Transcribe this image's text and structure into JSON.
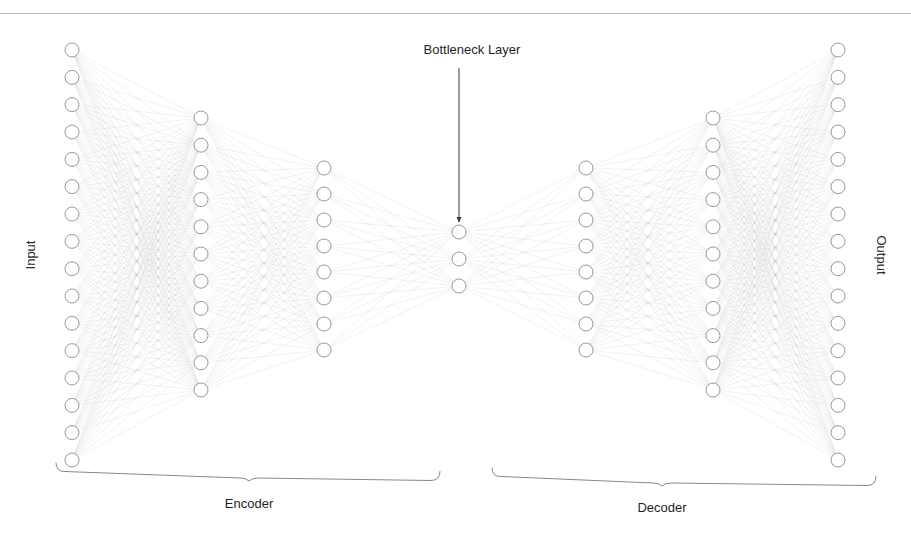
{
  "figure": {
    "title_visible": false,
    "corner_mark": "",
    "background": "#ffffff",
    "width": 911,
    "height": 542
  },
  "labels": {
    "input": "Input",
    "output": "Output",
    "bottleneck": "Bottleneck Layer",
    "encoder": "Encoder",
    "decoder": "Decoder"
  },
  "style": {
    "node_fill": "#ffffff",
    "node_stroke": "#8c8c8c",
    "node_radius": 7,
    "edge_color": "#b0b0b0",
    "edge_width": 0.35,
    "edge_opacity": 0.45,
    "brace_color": "#7a7a7a",
    "arrow_color": "#3a3a3a",
    "rule_color": "#b9b9bd",
    "text_color": "#1f1f1f"
  },
  "chart_data": {
    "type": "diagram",
    "diagram_kind": "neural-network-autoencoder",
    "title": "Bottleneck Layer",
    "layers": [
      {
        "name": "Input",
        "role": "input",
        "units": 16,
        "x": 72,
        "y_top": 50,
        "y_bottom": 460
      },
      {
        "name": "Encoder Hidden 1",
        "role": "encoder",
        "units": 11,
        "x": 201,
        "y_top": 118,
        "y_bottom": 390
      },
      {
        "name": "Encoder Hidden 2",
        "role": "encoder",
        "units": 8,
        "x": 324,
        "y_top": 168,
        "y_bottom": 350
      },
      {
        "name": "Bottleneck",
        "role": "bottleneck",
        "units": 3,
        "x": 459,
        "y_top": 232,
        "y_bottom": 286
      },
      {
        "name": "Decoder Hidden 1",
        "role": "decoder",
        "units": 8,
        "x": 586,
        "y_top": 168,
        "y_bottom": 350
      },
      {
        "name": "Decoder Hidden 2",
        "role": "decoder",
        "units": 11,
        "x": 713,
        "y_top": 118,
        "y_bottom": 390
      },
      {
        "name": "Output",
        "role": "output",
        "units": 16,
        "x": 838,
        "y_top": 50,
        "y_bottom": 460
      }
    ],
    "layer_sizes": [
      16,
      11,
      8,
      3,
      8,
      11,
      16
    ],
    "connectivity": "fully-connected between adjacent layers",
    "annotations": [
      {
        "text": "Bottleneck Layer",
        "target_layer": "Bottleneck",
        "arrow_from": {
          "x": 459,
          "y": 68
        },
        "arrow_to": {
          "x": 459,
          "y": 222
        }
      }
    ],
    "groups": [
      {
        "label": "Encoder",
        "x_start": 56,
        "x_end": 440,
        "tip_x": 249,
        "brace_y": 472,
        "label_y": 503
      },
      {
        "label": "Decoder",
        "x_start": 492,
        "x_end": 876,
        "tip_x": 662,
        "brace_y": 477,
        "label_y": 508
      }
    ],
    "legend": null,
    "grid": false
  }
}
